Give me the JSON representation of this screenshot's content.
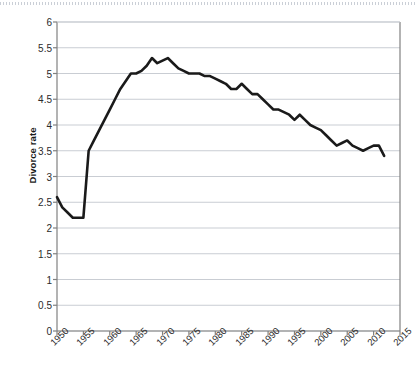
{
  "chart_data": {
    "type": "line",
    "title": "",
    "xlabel": "",
    "ylabel": "Divorce rate",
    "xlim": [
      1950,
      2015
    ],
    "ylim": [
      0,
      6
    ],
    "ytick_step": 0.5,
    "xtick_step": 5,
    "grid": true,
    "legend": false,
    "line_color": "#1a1a1a",
    "grid_color": "#c9cdd3",
    "axis_color": "#808080",
    "background": "#ffffff",
    "yticks": [
      "0",
      "0.5",
      "1",
      "1.5",
      "2",
      "2.5",
      "3",
      "3.5",
      "4",
      "4.5",
      "5",
      "5.5",
      "6"
    ],
    "xticks": [
      "1950",
      "1955",
      "1960",
      "1965",
      "1970",
      "1975",
      "1980",
      "1985",
      "1990",
      "1995",
      "2000",
      "2005",
      "2010",
      "2015"
    ],
    "x": [
      1950,
      1951,
      1952,
      1953,
      1954,
      1955,
      1956,
      1957,
      1958,
      1959,
      1960,
      1961,
      1962,
      1963,
      1964,
      1965,
      1966,
      1967,
      1968,
      1969,
      1970,
      1971,
      1972,
      1973,
      1974,
      1975,
      1976,
      1977,
      1978,
      1979,
      1980,
      1981,
      1982,
      1983,
      1984,
      1985,
      1986,
      1987,
      1988,
      1989,
      1990,
      1991,
      1992,
      1993,
      1994,
      1995,
      1996,
      1997,
      1998,
      1999,
      2000,
      2001,
      2002,
      2003,
      2004,
      2005,
      2006,
      2007,
      2008,
      2009,
      2010,
      2011,
      2012
    ],
    "values": [
      2.6,
      2.4,
      2.3,
      2.2,
      2.2,
      2.2,
      3.5,
      3.7,
      3.9,
      4.1,
      4.3,
      4.5,
      4.7,
      4.85,
      5.0,
      5.0,
      5.05,
      5.15,
      5.3,
      5.2,
      5.25,
      5.3,
      5.2,
      5.1,
      5.05,
      5.0,
      5.0,
      5.0,
      4.95,
      4.95,
      4.9,
      4.85,
      4.8,
      4.7,
      4.7,
      4.8,
      4.7,
      4.6,
      4.6,
      4.5,
      4.4,
      4.3,
      4.3,
      4.25,
      4.2,
      4.1,
      4.2,
      4.1,
      4.0,
      3.95,
      3.9,
      3.8,
      3.7,
      3.6,
      3.65,
      3.7,
      3.6,
      3.55,
      3.5,
      3.55,
      3.6,
      3.6,
      3.4
    ]
  }
}
